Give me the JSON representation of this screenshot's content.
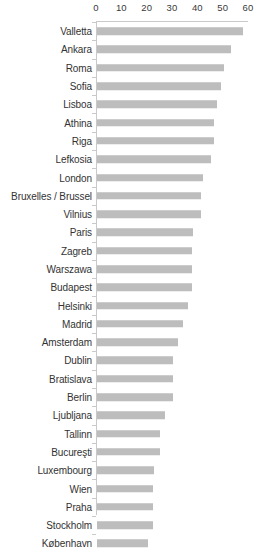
{
  "chart_data": {
    "type": "bar",
    "orientation": "horizontal",
    "title": "",
    "subtitle": "",
    "xlabel": "",
    "ylabel": "",
    "xlim": [
      0,
      60
    ],
    "ylim": null,
    "grid": false,
    "legend": null,
    "axis_position": "top",
    "tick_labels": [
      "0",
      "10",
      "20",
      "30",
      "40",
      "50",
      "60"
    ],
    "ticks": [
      0,
      10,
      20,
      30,
      40,
      50,
      60
    ],
    "bar_color": "#bdbdbd",
    "axis_color": "#c9c9c9",
    "text_color": "#333333",
    "categories": [
      "Valletta",
      "Ankara",
      "Roma",
      "Sofia",
      "Lisboa",
      "Athina",
      "Riga",
      "Lefkosia",
      "London",
      "Bruxelles / Brussel",
      "Vilnius",
      "Paris",
      "Zagreb",
      "Warszawa",
      "Budapest",
      "Helsinki",
      "Madrid",
      "Amsterdam",
      "Dublin",
      "Bratislava",
      "Berlin",
      "Ljubljana",
      "Tallinn",
      "Bucureşti",
      "Luxembourg",
      "Wien",
      "Praha",
      "Stockholm",
      "København"
    ],
    "values": [
      57.5,
      53.0,
      50.0,
      49.0,
      47.5,
      46.0,
      46.0,
      45.0,
      42.0,
      41.0,
      41.0,
      38.0,
      37.5,
      37.5,
      37.5,
      36.0,
      34.0,
      32.0,
      30.0,
      30.0,
      30.0,
      27.0,
      25.0,
      25.0,
      22.5,
      22.0,
      22.0,
      22.0,
      20.0
    ]
  }
}
